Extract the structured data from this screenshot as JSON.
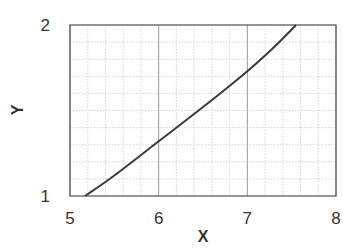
{
  "chart_data": {
    "type": "line",
    "title": "",
    "xlabel": "X",
    "ylabel": "Y",
    "xlim": [
      5,
      8
    ],
    "ylim": [
      1,
      2
    ],
    "x_ticks": [
      5,
      6,
      7,
      8
    ],
    "y_ticks": [
      1,
      2
    ],
    "x_minor_step": 0.2,
    "y_minor_step": 0.1,
    "grid": true,
    "legend": null,
    "series": [
      {
        "name": "curve",
        "color": "#3a3a3a",
        "x": [
          5.17,
          5.5,
          6.0,
          6.5,
          7.0,
          7.3,
          7.55
        ],
        "y": [
          1.0,
          1.12,
          1.32,
          1.52,
          1.73,
          1.87,
          2.0
        ]
      }
    ]
  },
  "axes": {
    "x_title": "X",
    "y_title": "Y",
    "x_tick_labels": [
      "5",
      "6",
      "7",
      "8"
    ],
    "y_tick_labels": [
      "1",
      "2"
    ]
  },
  "colors": {
    "frame": "#555555",
    "major_grid": "#999999",
    "minor_grid": "#cccccc",
    "line": "#3a3a3a"
  }
}
